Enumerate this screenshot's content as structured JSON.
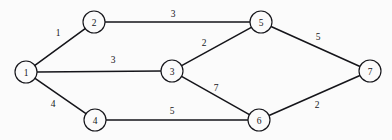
{
  "chart_data": {
    "type": "diagram",
    "title": "",
    "subtitle": "",
    "xlabel": "",
    "ylabel": "",
    "graph_kind": "weighted-undirected-graph",
    "layout_hint": "left-to-right layered node-link diagram, black lines on off-white background",
    "canvas": {
      "width": 392,
      "height": 140
    },
    "colors": {
      "background": "#fbfbfb",
      "edge": "#15151a",
      "node_stroke": "#15151a",
      "node_fill": "#fbfbfb",
      "text": "#15151a"
    },
    "node_radius": 11,
    "nodes": [
      {
        "id": "1",
        "label": "1",
        "x": 26,
        "y": 72
      },
      {
        "id": "2",
        "label": "2",
        "x": 94,
        "y": 22
      },
      {
        "id": "3",
        "label": "3",
        "x": 172,
        "y": 71
      },
      {
        "id": "4",
        "label": "4",
        "x": 95,
        "y": 120
      },
      {
        "id": "5",
        "label": "5",
        "x": 261,
        "y": 22
      },
      {
        "id": "6",
        "label": "6",
        "x": 259,
        "y": 120
      },
      {
        "id": "7",
        "label": "7",
        "x": 370,
        "y": 71
      }
    ],
    "edges": [
      {
        "id": "e-1-2",
        "source": "1",
        "target": "2",
        "weight": 1,
        "label": "1",
        "label_x": 58,
        "label_y": 33
      },
      {
        "id": "e-2-5",
        "source": "2",
        "target": "5",
        "weight": 3,
        "label": "3",
        "label_x": 173,
        "label_y": 14
      },
      {
        "id": "e-1-3",
        "source": "1",
        "target": "3",
        "weight": 3,
        "label": "3",
        "label_x": 113,
        "label_y": 60
      },
      {
        "id": "e-3-5",
        "source": "3",
        "target": "5",
        "weight": 2,
        "label": "2",
        "label_x": 204,
        "label_y": 43
      },
      {
        "id": "e-5-7",
        "source": "5",
        "target": "7",
        "weight": 5,
        "label": "5",
        "label_x": 318,
        "label_y": 37
      },
      {
        "id": "e-1-4",
        "source": "1",
        "target": "4",
        "weight": 4,
        "label": "4",
        "label_x": 53,
        "label_y": 104
      },
      {
        "id": "e-3-6",
        "source": "3",
        "target": "6",
        "weight": 7,
        "label": "7",
        "label_x": 216,
        "label_y": 88
      },
      {
        "id": "e-4-6",
        "source": "4",
        "target": "6",
        "weight": 5,
        "label": "5",
        "label_x": 172,
        "label_y": 111
      },
      {
        "id": "e-6-7",
        "source": "6",
        "target": "7",
        "weight": 2,
        "label": "2",
        "label_x": 317,
        "label_y": 105
      }
    ],
    "adjacency_weights": {
      "1": {
        "2": 1,
        "3": 3,
        "4": 4
      },
      "2": {
        "1": 1,
        "5": 3
      },
      "3": {
        "1": 3,
        "5": 2,
        "6": 7
      },
      "4": {
        "1": 4,
        "6": 5
      },
      "5": {
        "2": 3,
        "3": 2,
        "7": 5
      },
      "6": {
        "3": 7,
        "4": 5,
        "7": 2
      },
      "7": {
        "5": 5,
        "6": 2
      }
    }
  }
}
